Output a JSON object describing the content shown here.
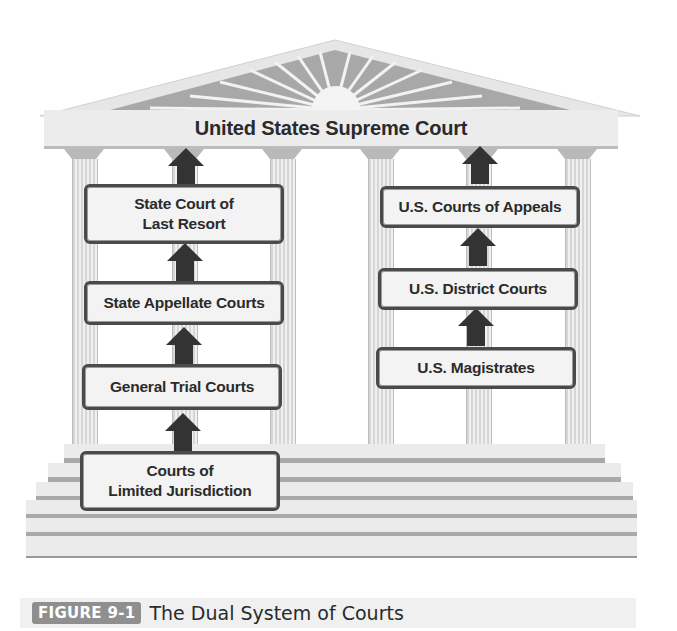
{
  "diagram": {
    "title": "United States Supreme Court",
    "state_courts": [
      {
        "label_line1": "State Court of",
        "label_line2": "Last Resort"
      },
      {
        "label_line1": "State Appellate Courts"
      },
      {
        "label_line1": "General Trial Courts"
      },
      {
        "label_line1": "Courts of",
        "label_line2": "Limited Jurisdiction"
      }
    ],
    "federal_courts": [
      {
        "label_line1": "U.S. Courts of Appeals"
      },
      {
        "label_line1": "U.S. District Courts"
      },
      {
        "label_line1": "U.S. Magistrates"
      }
    ],
    "arrow_color": "#333333",
    "building_color": "#e8e8e8"
  },
  "caption": {
    "figure_label": "FIGURE 9-1",
    "text": "The Dual System of Courts"
  }
}
